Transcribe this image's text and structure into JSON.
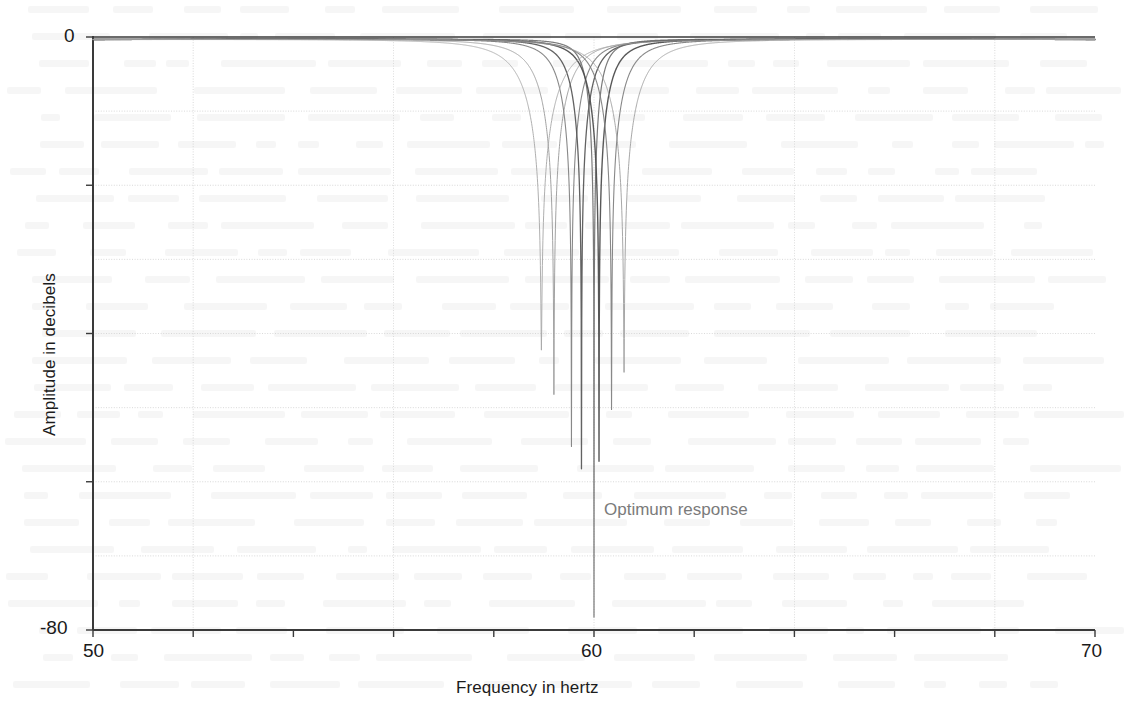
{
  "figure": {
    "background_color": "#ffffff",
    "axis_color": "#3a3a3a",
    "grid_color": "#c9c9c9",
    "annotation_color": "#7b7b7b"
  },
  "axes": {
    "x_label": "Frequency in hertz",
    "y_label": "Amplitude in decibels",
    "x_ticks": [
      {
        "value": 50,
        "label": "50"
      },
      {
        "value": 52,
        "label": ""
      },
      {
        "value": 54,
        "label": ""
      },
      {
        "value": 56,
        "label": ""
      },
      {
        "value": 58,
        "label": ""
      },
      {
        "value": 60,
        "label": "60"
      },
      {
        "value": 62,
        "label": ""
      },
      {
        "value": 64,
        "label": ""
      },
      {
        "value": 66,
        "label": ""
      },
      {
        "value": 68,
        "label": ""
      },
      {
        "value": 70,
        "label": "70"
      }
    ],
    "y_ticks": [
      {
        "value": 0,
        "label": "0"
      },
      {
        "value": -20,
        "label": ""
      },
      {
        "value": -40,
        "label": ""
      },
      {
        "value": -60,
        "label": ""
      },
      {
        "value": -80,
        "label": "-80"
      }
    ],
    "x_gridlines": [
      52,
      56,
      60,
      64,
      68
    ],
    "y_gridlines": [
      -10,
      -20,
      -30,
      -40,
      -50,
      -60,
      -70
    ]
  },
  "annotations": [
    {
      "id": "optimum-response",
      "text": "Optimum response",
      "x": 60.0,
      "y": -62.5,
      "color": "#7b7b7b"
    }
  ],
  "chart_data": {
    "type": "line",
    "title": "",
    "subtitle": "",
    "xlabel": "Frequency in hertz",
    "ylabel": "Amplitude in decibels",
    "xlim": [
      50,
      70
    ],
    "ylim": [
      -80,
      0
    ],
    "xtick_labels": [
      "50",
      "60",
      "70"
    ],
    "ytick_labels": [
      "0",
      "-80"
    ],
    "grid": true,
    "legend": null,
    "legend_position": "none",
    "series": [
      {
        "name": "response-1",
        "notch_hz": 59.2,
        "depth_db": -48,
        "bandwidth_hz": 1.15,
        "color": "#9a9a9a",
        "width": 1.0,
        "values": [
          {
            "x": 50.0,
            "y": -0.35
          },
          {
            "x": 52.0,
            "y": -0.75
          },
          {
            "x": 54.0,
            "y": -1.5
          },
          {
            "x": 56.0,
            "y": -3.6
          },
          {
            "x": 57.5,
            "y": -7.2
          },
          {
            "x": 58.4,
            "y": -13.5
          },
          {
            "x": 58.9,
            "y": -22.0
          },
          {
            "x": 59.15,
            "y": -40.0
          },
          {
            "x": 59.2,
            "y": -48.0
          },
          {
            "x": 59.25,
            "y": -40.0
          },
          {
            "x": 59.5,
            "y": -22.5
          },
          {
            "x": 60.0,
            "y": -13.0
          },
          {
            "x": 61.0,
            "y": -7.0
          },
          {
            "x": 63.0,
            "y": -3.3
          },
          {
            "x": 66.0,
            "y": -1.4
          },
          {
            "x": 70.0,
            "y": -0.55
          }
        ]
      },
      {
        "name": "response-2",
        "notch_hz": 59.55,
        "depth_db": -55,
        "bandwidth_hz": 0.9,
        "color": "#7e7e7e",
        "width": 1.1,
        "values": [
          {
            "x": 50.0,
            "y": -0.3
          },
          {
            "x": 53.0,
            "y": -1.0
          },
          {
            "x": 56.0,
            "y": -3.2
          },
          {
            "x": 58.0,
            "y": -8.2
          },
          {
            "x": 59.0,
            "y": -17.0
          },
          {
            "x": 59.4,
            "y": -28.0
          },
          {
            "x": 59.55,
            "y": -55.0
          },
          {
            "x": 59.7,
            "y": -28.0
          },
          {
            "x": 60.2,
            "y": -16.0
          },
          {
            "x": 61.5,
            "y": -7.5
          },
          {
            "x": 64.0,
            "y": -3.2
          },
          {
            "x": 70.0,
            "y": -0.5
          }
        ]
      },
      {
        "name": "response-3",
        "notch_hz": 59.75,
        "depth_db": -58,
        "bandwidth_hz": 0.8,
        "color": "#555555",
        "width": 1.3,
        "values": [
          {
            "x": 50.0,
            "y": -0.3
          },
          {
            "x": 53.0,
            "y": -1.05
          },
          {
            "x": 56.0,
            "y": -3.4
          },
          {
            "x": 58.0,
            "y": -9.0
          },
          {
            "x": 59.2,
            "y": -19.0
          },
          {
            "x": 59.6,
            "y": -31.0
          },
          {
            "x": 59.75,
            "y": -58.0
          },
          {
            "x": 59.9,
            "y": -31.0
          },
          {
            "x": 60.4,
            "y": -16.5
          },
          {
            "x": 61.8,
            "y": -7.4
          },
          {
            "x": 64.5,
            "y": -3.1
          },
          {
            "x": 70.0,
            "y": -0.5
          }
        ]
      },
      {
        "name": "response-4-optimum",
        "notch_hz": 60.0,
        "depth_db": -78,
        "bandwidth_hz": 0.55,
        "color": "#6f6f6f",
        "width": 1.2,
        "is_optimum": true,
        "values": [
          {
            "x": 50.0,
            "y": -0.28
          },
          {
            "x": 53.0,
            "y": -0.95
          },
          {
            "x": 56.0,
            "y": -3.0
          },
          {
            "x": 58.0,
            "y": -8.5
          },
          {
            "x": 59.3,
            "y": -20.0
          },
          {
            "x": 59.8,
            "y": -34.0
          },
          {
            "x": 59.95,
            "y": -55.0
          },
          {
            "x": 60.0,
            "y": -78.0
          },
          {
            "x": 60.05,
            "y": -55.0
          },
          {
            "x": 60.2,
            "y": -34.0
          },
          {
            "x": 60.7,
            "y": -18.0
          },
          {
            "x": 62.0,
            "y": -7.6
          },
          {
            "x": 65.0,
            "y": -3.0
          },
          {
            "x": 70.0,
            "y": -0.5
          }
        ]
      },
      {
        "name": "response-5",
        "notch_hz": 60.1,
        "depth_db": -57,
        "bandwidth_hz": 0.85,
        "color": "#4a4a4a",
        "width": 1.4,
        "values": [
          {
            "x": 50.0,
            "y": -0.3
          },
          {
            "x": 53.0,
            "y": -1.0
          },
          {
            "x": 56.0,
            "y": -3.1
          },
          {
            "x": 58.2,
            "y": -8.8
          },
          {
            "x": 59.5,
            "y": -19.5
          },
          {
            "x": 59.95,
            "y": -31.0
          },
          {
            "x": 60.1,
            "y": -57.0
          },
          {
            "x": 60.25,
            "y": -31.0
          },
          {
            "x": 60.7,
            "y": -17.0
          },
          {
            "x": 62.0,
            "y": -7.8
          },
          {
            "x": 65.0,
            "y": -3.2
          },
          {
            "x": 70.0,
            "y": -0.52
          }
        ]
      },
      {
        "name": "response-6",
        "notch_hz": 60.35,
        "depth_db": -50,
        "bandwidth_hz": 1.0,
        "color": "#7e7e7e",
        "width": 1.1,
        "values": [
          {
            "x": 50.0,
            "y": -0.32
          },
          {
            "x": 53.0,
            "y": -1.05
          },
          {
            "x": 56.0,
            "y": -3.2
          },
          {
            "x": 58.4,
            "y": -8.6
          },
          {
            "x": 59.7,
            "y": -18.0
          },
          {
            "x": 60.2,
            "y": -28.0
          },
          {
            "x": 60.35,
            "y": -50.0
          },
          {
            "x": 60.5,
            "y": -28.0
          },
          {
            "x": 61.0,
            "y": -16.0
          },
          {
            "x": 62.4,
            "y": -7.6
          },
          {
            "x": 65.5,
            "y": -3.1
          },
          {
            "x": 70.0,
            "y": -0.5
          }
        ]
      },
      {
        "name": "response-7",
        "notch_hz": 60.6,
        "depth_db": -45,
        "bandwidth_hz": 1.3,
        "color": "#a0a0a0",
        "width": 1.0,
        "values": [
          {
            "x": 50.0,
            "y": -0.35
          },
          {
            "x": 53.0,
            "y": -1.1
          },
          {
            "x": 56.0,
            "y": -3.4
          },
          {
            "x": 58.5,
            "y": -8.4
          },
          {
            "x": 59.9,
            "y": -16.5
          },
          {
            "x": 60.45,
            "y": -26.0
          },
          {
            "x": 60.6,
            "y": -45.0
          },
          {
            "x": 60.78,
            "y": -26.0
          },
          {
            "x": 61.3,
            "y": -15.0
          },
          {
            "x": 62.8,
            "y": -7.4
          },
          {
            "x": 66.0,
            "y": -3.0
          },
          {
            "x": 70.0,
            "y": -0.48
          }
        ]
      },
      {
        "name": "response-8",
        "notch_hz": 58.95,
        "depth_db": -42,
        "bandwidth_hz": 1.4,
        "color": "#a8a8a8",
        "width": 1.0,
        "values": [
          {
            "x": 50.0,
            "y": -0.4
          },
          {
            "x": 53.0,
            "y": -1.2
          },
          {
            "x": 55.5,
            "y": -3.4
          },
          {
            "x": 57.3,
            "y": -7.6
          },
          {
            "x": 58.4,
            "y": -15.0
          },
          {
            "x": 58.82,
            "y": -25.0
          },
          {
            "x": 58.95,
            "y": -42.0
          },
          {
            "x": 59.1,
            "y": -25.0
          },
          {
            "x": 59.6,
            "y": -14.0
          },
          {
            "x": 61.0,
            "y": -6.8
          },
          {
            "x": 64.0,
            "y": -2.9
          },
          {
            "x": 70.0,
            "y": -0.55
          }
        ]
      }
    ]
  }
}
